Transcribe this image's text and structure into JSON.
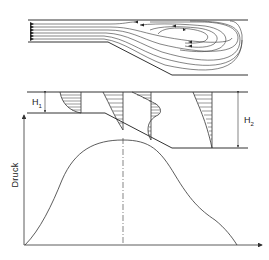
{
  "figure": {
    "panels": [
      {
        "id": "streamlines",
        "description": "Flow streamlines over a backward-facing ramp (diffuser) with recirculation zone"
      },
      {
        "id": "velocity-profiles",
        "description": "Velocity profiles at four stations across the expansion"
      },
      {
        "id": "pressure-curve",
        "description": "Pressure distribution along the channel"
      }
    ],
    "labels": {
      "h1_main": "H",
      "h1_sub": "1",
      "h2_main": "H",
      "h2_sub": "2",
      "y_axis": "Druck"
    },
    "colors": {
      "line": "#333333",
      "background": "#ffffff"
    }
  }
}
